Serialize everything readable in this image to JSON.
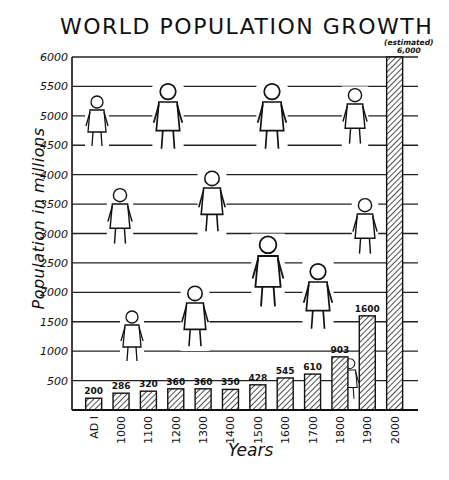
{
  "title": "WORLD POPULATION GROWTH",
  "annotation": {
    "estimated_label": "(estimated)",
    "estimated_value": "6,000"
  },
  "chart_data": {
    "type": "bar",
    "title": "WORLD POPULATION GROWTH",
    "xlabel": "Years",
    "ylabel": "Population in millions",
    "ylim": [
      0,
      6000
    ],
    "yticks": [
      500,
      1000,
      1500,
      2000,
      2500,
      3000,
      3500,
      4000,
      4500,
      5000,
      5500,
      6000
    ],
    "grid": true,
    "categories": [
      "AD I",
      "1000",
      "1100",
      "1200",
      "1300",
      "1400",
      "1500",
      "1600",
      "1700",
      "1800",
      "1900",
      "2000"
    ],
    "values": [
      200,
      286,
      320,
      360,
      360,
      350,
      428,
      545,
      610,
      903,
      1600,
      6000
    ],
    "value_labels": [
      "200",
      "286",
      "320",
      "360",
      "360",
      "350",
      "428",
      "545",
      "610",
      "903",
      "1600",
      "6,000"
    ],
    "annotations": [
      "(estimated) 6,000 for 2000"
    ],
    "bar_style": "diagonal hatch"
  },
  "illustrations": [
    "primitive-man",
    "horseman",
    "dancer",
    "girl-with-flowers",
    "fur-clad-child",
    "traveler-with-basket",
    "boy-in-striped-shirt",
    "monk",
    "spear-thrower",
    "woman-with-jar",
    "roman-child",
    "girl-1800"
  ]
}
